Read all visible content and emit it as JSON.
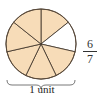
{
  "diagram": {
    "type": "fraction-circle",
    "total_parts": 7,
    "shaded_parts": 6,
    "colors": {
      "shaded": "#f7dcb8",
      "unshaded": "#ffffff",
      "stroke": "#3a2e25"
    },
    "fraction": {
      "numerator": "6",
      "denominator": "7"
    },
    "brace_label": "1 unit"
  }
}
